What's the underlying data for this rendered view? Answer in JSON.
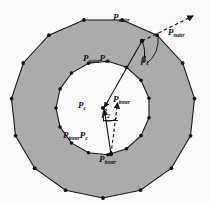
{
  "figure": {
    "name": "concentric-polygon-annulus-diagram",
    "background_color": "#fbfbfb",
    "fill_color": "#ababab",
    "stroke_color": "#1a1a1a",
    "vertex_color": "#111111"
  },
  "labels": {
    "outer_point_top": {
      "base": "P",
      "sub": "outer"
    },
    "outer_direction": {
      "base": "P",
      "sub": "outer"
    },
    "outer_vector": {
      "base": "P",
      "sub": "outer",
      "base2": "P",
      "sub2": "c"
    },
    "inner_vector": {
      "base": "P",
      "sub": "inner",
      "base2": "P",
      "sub2": "c"
    },
    "center_point": {
      "base": "P",
      "sub": "c"
    },
    "inner_point_right": {
      "base": "P",
      "sub": "inner"
    },
    "inner_point_bottom": {
      "base": "P",
      "sub": "inner"
    },
    "angle_beta_1": {
      "base": "β",
      "sub": "1"
    },
    "angle_beta_2": {
      "base": "β",
      "sub": "2"
    }
  },
  "geometry": {
    "center": {
      "x": 103,
      "y": 108
    },
    "outer_polygon": {
      "sides": 15,
      "radius_x": 92,
      "radius_y": 90,
      "rotation_deg": 12,
      "vertex_count": 15
    },
    "inner_polygon": {
      "sides": 15,
      "radius_x": 47,
      "radius_y": 47,
      "rotation_deg": 6,
      "vertex_count": 15
    },
    "points": {
      "p_outer": {
        "x": 142,
        "y": 41
      },
      "p_inner": {
        "x": 111,
        "y": 154
      },
      "p_c": {
        "x": 103,
        "y": 108
      }
    },
    "outer_arrow_tip": {
      "x": 196,
      "y": 14
    },
    "inner_arrow_tip": {
      "x": 117,
      "y": 100
    }
  }
}
